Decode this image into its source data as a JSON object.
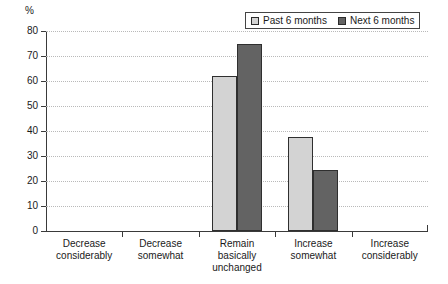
{
  "chart_data": {
    "type": "bar",
    "title": "",
    "subtitle": "",
    "xlabel": "",
    "ylabel": "%",
    "unit_label": "%",
    "ylim": [
      0,
      80
    ],
    "ytick_step": 10,
    "ytick_labels": [
      "80",
      "70",
      "60",
      "50",
      "40",
      "30",
      "20",
      "10",
      "0"
    ],
    "ytick_values": [
      80,
      70,
      60,
      50,
      40,
      30,
      20,
      10,
      0
    ],
    "grid": true,
    "grid_style": "dotted-horizontal",
    "legend_position": "top-right",
    "categories": [
      "Decrease\nconsiderably",
      "Decrease\nsomewhat",
      "Remain\nbasically\nunchanged",
      "Increase\nsomewhat",
      "Increase\nconsiderably"
    ],
    "series": [
      {
        "name": "Past 6 months",
        "color": "#d3d3d3",
        "values": [
          0,
          0,
          62,
          37.5,
          0
        ]
      },
      {
        "name": "Next 6 months",
        "color": "#636363",
        "values": [
          0,
          0,
          75,
          24.5,
          0
        ]
      }
    ]
  },
  "legend": {
    "items": [
      {
        "label": "Past 6 months",
        "swatch": "legend-swatch-past",
        "color": "#d3d3d3"
      },
      {
        "label": "Next 6 months",
        "swatch": "legend-swatch-next",
        "color": "#636363"
      }
    ]
  },
  "colors": {
    "past": "#d3d3d3",
    "next": "#636363",
    "axis": "#3a3a3a",
    "grid": "#b9b9b9",
    "background": "#ffffff"
  }
}
